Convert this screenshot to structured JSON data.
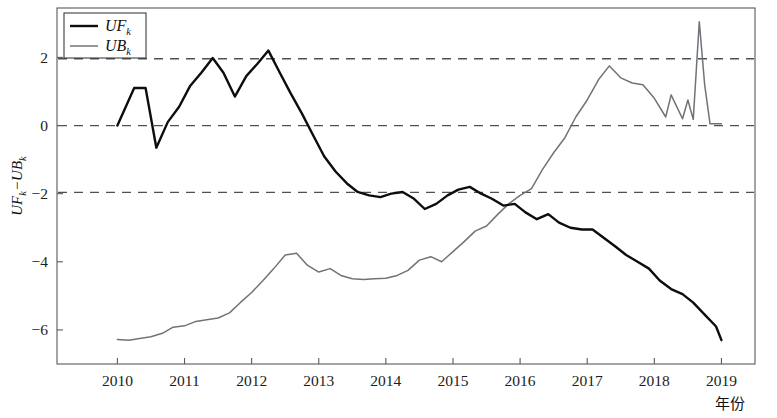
{
  "chart_data": {
    "type": "line",
    "title": "",
    "xlabel": "年份",
    "ylabel": "UFₖ−UBₖ",
    "ylabel_parts": {
      "uf": "UF",
      "sub_k1": "k",
      "minus": "−",
      "ub": "UB",
      "sub_k2": "k"
    },
    "xlim": [
      2009.1,
      2019.5
    ],
    "ylim": [
      -7.0,
      3.45
    ],
    "xticks": [
      2010,
      2011,
      2012,
      2013,
      2014,
      2015,
      2016,
      2017,
      2018,
      2019
    ],
    "xtick_labels": [
      "2010",
      "2011",
      "2012",
      "2013",
      "2014",
      "2015",
      "2016",
      "2017",
      "2018",
      "2019"
    ],
    "yticks": [
      2,
      0,
      -2,
      -4,
      -6
    ],
    "ytick_labels": [
      "2",
      "0",
      "−2",
      "−4",
      "−6"
    ],
    "grid": false,
    "dashed_reference_lines": [
      1.96,
      0,
      -1.96
    ],
    "legend_position": "top-left",
    "legend": [
      {
        "name": "UF",
        "sub": "k",
        "color": "#0d0d0d"
      },
      {
        "name": "UB",
        "sub": "k",
        "color": "#6f7478"
      }
    ],
    "series": [
      {
        "name": "UF_k",
        "color": "#0d0d0d",
        "x": [
          2010.0,
          2010.25,
          2010.42,
          2010.58,
          2010.75,
          2010.92,
          2011.08,
          2011.25,
          2011.42,
          2011.58,
          2011.75,
          2011.92,
          2012.08,
          2012.25,
          2012.42,
          2012.58,
          2012.75,
          2012.92,
          2013.08,
          2013.25,
          2013.42,
          2013.58,
          2013.75,
          2013.92,
          2014.08,
          2014.25,
          2014.42,
          2014.58,
          2014.75,
          2014.92,
          2015.08,
          2015.25,
          2015.42,
          2015.58,
          2015.75,
          2015.92,
          2016.08,
          2016.25,
          2016.42,
          2016.58,
          2016.75,
          2016.92,
          2017.08,
          2017.25,
          2017.42,
          2017.58,
          2017.75,
          2017.92,
          2018.08,
          2018.25,
          2018.42,
          2018.58,
          2018.75,
          2018.92,
          2019.0
        ],
        "y": [
          0.0,
          1.1,
          1.1,
          -0.65,
          0.1,
          0.55,
          1.15,
          1.55,
          1.98,
          1.55,
          0.85,
          1.45,
          1.8,
          2.2,
          1.55,
          0.95,
          0.35,
          -0.3,
          -0.9,
          -1.35,
          -1.7,
          -1.95,
          -2.05,
          -2.1,
          -2.0,
          -1.95,
          -2.15,
          -2.45,
          -2.3,
          -2.05,
          -1.88,
          -1.8,
          -2.0,
          -2.15,
          -2.35,
          -2.3,
          -2.55,
          -2.75,
          -2.6,
          -2.85,
          -3.0,
          -3.05,
          -3.05,
          -3.3,
          -3.55,
          -3.8,
          -4.0,
          -4.2,
          -4.55,
          -4.8,
          -4.95,
          -5.2,
          -5.55,
          -5.9,
          -6.3
        ]
      },
      {
        "name": "UB_k",
        "color": "#6f7478",
        "x": [
          2010.0,
          2010.17,
          2010.33,
          2010.5,
          2010.67,
          2010.83,
          2011.0,
          2011.17,
          2011.33,
          2011.5,
          2011.67,
          2011.83,
          2012.0,
          2012.17,
          2012.33,
          2012.5,
          2012.67,
          2012.83,
          2013.0,
          2013.17,
          2013.33,
          2013.5,
          2013.67,
          2013.83,
          2014.0,
          2014.17,
          2014.33,
          2014.5,
          2014.67,
          2014.83,
          2015.0,
          2015.17,
          2015.33,
          2015.5,
          2015.67,
          2015.83,
          2016.0,
          2016.17,
          2016.33,
          2016.5,
          2016.67,
          2016.83,
          2017.0,
          2017.17,
          2017.33,
          2017.5,
          2017.67,
          2017.83,
          2018.0,
          2018.17,
          2018.25,
          2018.42,
          2018.5,
          2018.58,
          2018.67,
          2018.75,
          2018.83,
          2018.92,
          2019.0
        ],
        "y": [
          -6.28,
          -6.3,
          -6.25,
          -6.2,
          -6.1,
          -5.92,
          -5.88,
          -5.75,
          -5.7,
          -5.65,
          -5.5,
          -5.2,
          -4.9,
          -4.55,
          -4.2,
          -3.8,
          -3.75,
          -4.1,
          -4.3,
          -4.2,
          -4.4,
          -4.5,
          -4.52,
          -4.5,
          -4.48,
          -4.4,
          -4.25,
          -3.95,
          -3.85,
          -4.0,
          -3.7,
          -3.4,
          -3.1,
          -2.95,
          -2.6,
          -2.3,
          -2.05,
          -1.85,
          -1.3,
          -0.8,
          -0.35,
          0.25,
          0.75,
          1.35,
          1.75,
          1.4,
          1.25,
          1.2,
          0.8,
          0.25,
          0.9,
          0.2,
          0.75,
          0.18,
          3.05,
          1.2,
          0.05,
          0.05,
          0.05
        ]
      }
    ]
  }
}
